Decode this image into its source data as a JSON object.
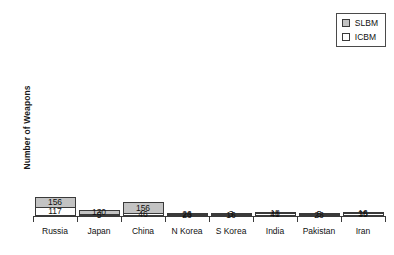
{
  "chart_data": {
    "type": "bar",
    "subtype": "stacked-bar",
    "title": "",
    "xlabel": "",
    "ylabel": "Number of Weapons",
    "ylim": [
      0,
      273
    ],
    "grid": false,
    "legend_position": "top-right",
    "categories": [
      "Russia",
      "Japan",
      "China",
      "N Korea",
      "S Korea",
      "India",
      "Pakistan",
      "Iran"
    ],
    "series": [
      {
        "name": "ICBM",
        "color": "#ffffff",
        "values": [
          117,
          5,
          46,
          23,
          16,
          41,
          23,
          35
        ]
      },
      {
        "name": "SLBM",
        "color": "#c3c3c3",
        "values": [
          156,
          130,
          156,
          26,
          3,
          18,
          5,
          16
        ]
      }
    ],
    "totals": [
      273,
      135,
      202,
      49,
      19,
      59,
      28,
      51
    ]
  },
  "axis": {
    "y_title": "Number of Weapons",
    "categories": [
      {
        "label": "Russia"
      },
      {
        "label": "Japan"
      },
      {
        "label": "China"
      },
      {
        "label": "N Korea"
      },
      {
        "label": "S Korea"
      },
      {
        "label": "India"
      },
      {
        "label": "Pakistan"
      },
      {
        "label": "Iran"
      }
    ]
  },
  "legend": {
    "entries": [
      {
        "label": "SLBM",
        "swatch": "slbm"
      },
      {
        "label": "ICBM",
        "swatch": "icbm"
      }
    ]
  },
  "bars": [
    {
      "category": "Russia",
      "slbm_label": "156",
      "icbm_label": "117",
      "slbm_height_pct": 57.14,
      "icbm_height_pct": 42.86,
      "slbm_thin": false,
      "icbm_thin": false
    },
    {
      "category": "Japan",
      "slbm_label": "130",
      "icbm_label": "5",
      "slbm_height_pct": 47.62,
      "icbm_height_pct": 1.83,
      "slbm_thin": false,
      "icbm_thin": true
    },
    {
      "category": "China",
      "slbm_label": "156",
      "icbm_label": "46",
      "slbm_height_pct": 57.14,
      "icbm_height_pct": 16.85,
      "slbm_thin": false,
      "icbm_thin": false
    },
    {
      "category": "N Korea",
      "slbm_label": "26",
      "icbm_label": "23",
      "slbm_height_pct": 9.52,
      "icbm_height_pct": 8.42,
      "slbm_thin": false,
      "icbm_thin": false
    },
    {
      "category": "S Korea",
      "slbm_label": "3",
      "icbm_label": "16",
      "slbm_height_pct": 1.1,
      "icbm_height_pct": 5.86,
      "slbm_thin": true,
      "icbm_thin": false
    },
    {
      "category": "India",
      "slbm_label": "18",
      "icbm_label": "41",
      "slbm_height_pct": 6.59,
      "icbm_height_pct": 15.02,
      "slbm_thin": false,
      "icbm_thin": false
    },
    {
      "category": "Pakistan",
      "slbm_label": "5",
      "icbm_label": "23",
      "slbm_height_pct": 1.83,
      "icbm_height_pct": 8.42,
      "slbm_thin": true,
      "icbm_thin": false
    },
    {
      "category": "Iran",
      "slbm_label": "16",
      "icbm_label": "35",
      "slbm_height_pct": 5.86,
      "icbm_height_pct": 12.82,
      "slbm_thin": false,
      "icbm_thin": false
    }
  ],
  "colors": {
    "slbm_fill": "#c3c3c3",
    "icbm_fill": "#ffffff",
    "stroke": "#3a3a3a",
    "background": "#ffffff"
  }
}
